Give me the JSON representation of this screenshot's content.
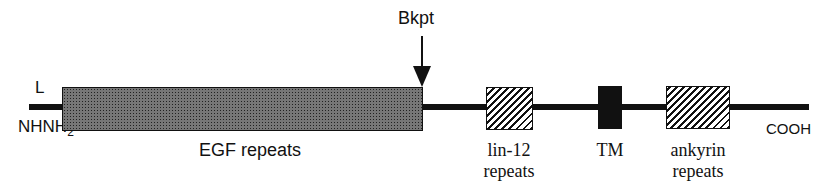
{
  "diagram": {
    "type": "protein-domain-map",
    "n_terminus_label": "NH2",
    "n_terminus_sub": "2",
    "leader_label": "L",
    "c_terminus_label": "COOH",
    "breakpoint_label": "Bkpt",
    "domains": [
      {
        "name": "EGF repeats",
        "label": "EGF repeats",
        "fill": "stippled"
      },
      {
        "name": "lin-12 repeats",
        "label_line1": "lin-12",
        "label_line2": "repeats",
        "fill": "hatched"
      },
      {
        "name": "TM",
        "label": "TM",
        "fill": "solid"
      },
      {
        "name": "ankyrin repeats",
        "label_line1": "ankyrin",
        "label_line2": "repeats",
        "fill": "hatched"
      }
    ]
  }
}
